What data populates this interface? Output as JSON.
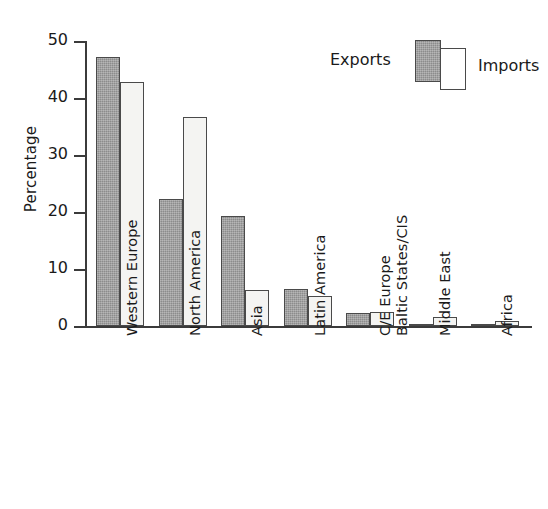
{
  "chart_data": {
    "type": "bar",
    "title": "",
    "subtitle": "",
    "xlabel": "",
    "ylabel": "Percentage",
    "ylim": [
      0,
      50
    ],
    "yticks": [
      0,
      10,
      20,
      30,
      40,
      50
    ],
    "ytick_labels": [
      "0",
      "10",
      "20",
      "30",
      "40",
      "50"
    ],
    "grid": false,
    "legend_position": "top-right",
    "categories": [
      "Western Europe",
      "North America",
      "Asia",
      "Latin America",
      "C/E Europe Baltic States/CIS",
      "Middle East",
      "Africa"
    ],
    "category_lines": [
      [
        "Western Europe"
      ],
      [
        "North America"
      ],
      [
        "Asia"
      ],
      [
        "Latin America"
      ],
      [
        "C/E Europe",
        "Baltic States/CIS"
      ],
      [
        "Middle East"
      ],
      [
        "Africa"
      ]
    ],
    "series": [
      {
        "name": "Exports",
        "color": "#9a9a9a",
        "values": [
          47.2,
          22.2,
          19.3,
          6.5,
          2.3,
          0.2,
          0.2
        ]
      },
      {
        "name": "Imports",
        "color": "#ffffff",
        "values": [
          42.8,
          36.7,
          6.4,
          5.2,
          2.5,
          1.6,
          0.9
        ]
      }
    ]
  },
  "legend": {
    "exports_label": "Exports",
    "imports_label": "Imports"
  },
  "axis": {
    "y_title": "Percentage"
  }
}
